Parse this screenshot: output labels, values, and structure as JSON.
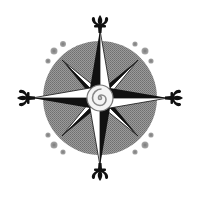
{
  "image": {
    "subject": "compass rose",
    "width": 197,
    "height": 200
  },
  "colors": {
    "background": "#ffffff",
    "disc": "#8a8a8a",
    "ink": "#111111",
    "light_facet": "#ffffff",
    "dot": "#8f8f8f"
  },
  "elements": {
    "disc": {
      "cx": 100,
      "cy": 98,
      "r": 57
    },
    "cardinal_points": [
      "north",
      "east",
      "south",
      "west"
    ],
    "ordinal_points": [
      "northeast",
      "southeast",
      "southwest",
      "northwest"
    ],
    "finials": "fleur-de-lis",
    "center": "spiral medallion",
    "corner_dots_per_quadrant": 3
  }
}
